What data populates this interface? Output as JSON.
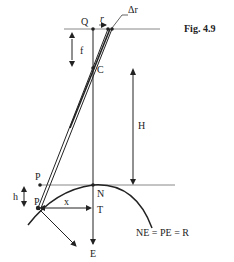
{
  "figure": {
    "caption": "Fig. 4.9",
    "equation": "NE = PE = R"
  },
  "labels": {
    "Q": "Q",
    "r": "r",
    "delta_r": "Δr",
    "f": "f",
    "C": "C",
    "H": "H",
    "P_upper": "P",
    "P_lower": "P",
    "h": "h",
    "N": "N",
    "x": "x",
    "T": "T",
    "E": "E"
  },
  "colors": {
    "line": "#222222",
    "guide": "#888888",
    "background": "#ffffff"
  }
}
